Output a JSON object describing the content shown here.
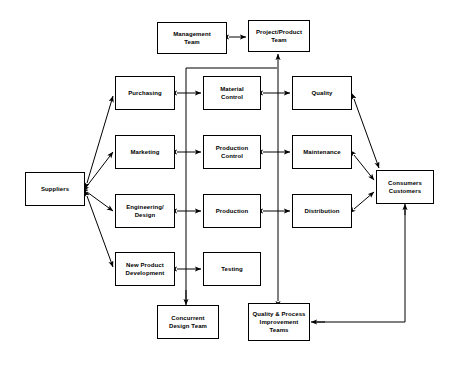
{
  "diagram": {
    "background_color": "#ffffff",
    "line_color": "#000000",
    "text_color": "#000000",
    "node_fill": "#ffffff",
    "nodes": [
      {
        "id": "management-team",
        "label": "Management\nTeam",
        "x": 157,
        "y": 22,
        "w": 70,
        "h": 32
      },
      {
        "id": "project-product-team",
        "label": "Project/Product\nTeam",
        "x": 248,
        "y": 20,
        "w": 62,
        "h": 32
      },
      {
        "id": "purchasing",
        "label": "Purchasing",
        "x": 115,
        "y": 76,
        "w": 60,
        "h": 34
      },
      {
        "id": "material-control",
        "label": "Material\nControl",
        "x": 203,
        "y": 76,
        "w": 58,
        "h": 34
      },
      {
        "id": "quality",
        "label": "Quality",
        "x": 292,
        "y": 76,
        "w": 60,
        "h": 34
      },
      {
        "id": "marketing",
        "label": "Marketing",
        "x": 115,
        "y": 135,
        "w": 60,
        "h": 34
      },
      {
        "id": "production-control",
        "label": "Production\nControl",
        "x": 203,
        "y": 135,
        "w": 58,
        "h": 34
      },
      {
        "id": "maintenance",
        "label": "Maintenance",
        "x": 292,
        "y": 135,
        "w": 60,
        "h": 34
      },
      {
        "id": "engineering-design",
        "label": "Engineering/\nDesign",
        "x": 115,
        "y": 194,
        "w": 60,
        "h": 34
      },
      {
        "id": "production",
        "label": "Production",
        "x": 203,
        "y": 194,
        "w": 58,
        "h": 34
      },
      {
        "id": "distribution",
        "label": "Distribution",
        "x": 292,
        "y": 194,
        "w": 60,
        "h": 34
      },
      {
        "id": "new-product-development",
        "label": "New Product\nDevelopment",
        "x": 115,
        "y": 252,
        "w": 60,
        "h": 34
      },
      {
        "id": "testing",
        "label": "Testing",
        "x": 203,
        "y": 252,
        "w": 58,
        "h": 34
      },
      {
        "id": "suppliers",
        "label": "Suppliers",
        "x": 25,
        "y": 172,
        "w": 60,
        "h": 34
      },
      {
        "id": "consumers-customers",
        "label": "Consumers\nCustomers",
        "x": 376,
        "y": 170,
        "w": 58,
        "h": 34
      },
      {
        "id": "concurrent-design-team",
        "label": "Concurrent\nDesign Team",
        "x": 157,
        "y": 305,
        "w": 62,
        "h": 34
      },
      {
        "id": "quality-process-teams",
        "label": "Quality & Process\nImprovement\nTeams",
        "x": 248,
        "y": 303,
        "w": 62,
        "h": 38
      }
    ],
    "connections": [
      {
        "from": "management-team",
        "to": "project-product-team",
        "style": "double-arrow",
        "path": "horizontal"
      },
      {
        "from": "purchasing",
        "to": "material-control",
        "style": "double-arrow",
        "path": "horizontal"
      },
      {
        "from": "material-control",
        "to": "quality",
        "style": "double-arrow",
        "path": "horizontal"
      },
      {
        "from": "marketing",
        "to": "production-control",
        "style": "double-arrow",
        "path": "horizontal"
      },
      {
        "from": "production-control",
        "to": "maintenance",
        "style": "double-arrow",
        "path": "horizontal"
      },
      {
        "from": "engineering-design",
        "to": "production",
        "style": "double-arrow",
        "path": "horizontal"
      },
      {
        "from": "production",
        "to": "distribution",
        "style": "double-arrow",
        "path": "horizontal"
      },
      {
        "from": "new-product-development",
        "to": "testing",
        "style": "double-arrow",
        "path": "horizontal"
      },
      {
        "from": "suppliers",
        "to": "purchasing",
        "style": "double-arrow",
        "path": "diagonal"
      },
      {
        "from": "suppliers",
        "to": "marketing",
        "style": "double-arrow",
        "path": "diagonal"
      },
      {
        "from": "suppliers",
        "to": "engineering-design",
        "style": "double-arrow",
        "path": "diagonal"
      },
      {
        "from": "suppliers",
        "to": "new-product-development",
        "style": "double-arrow",
        "path": "diagonal"
      },
      {
        "from": "quality",
        "to": "consumers-customers",
        "style": "double-arrow",
        "path": "diagonal"
      },
      {
        "from": "maintenance",
        "to": "consumers-customers",
        "style": "double-arrow",
        "path": "diagonal"
      },
      {
        "from": "distribution",
        "to": "consumers-customers",
        "style": "double-arrow",
        "path": "diagonal"
      },
      {
        "from": "concurrent-design-team",
        "to": "project-product-team",
        "style": "single-arrow",
        "path": "elbow-left"
      },
      {
        "from": "quality-process-teams",
        "to": "project-product-team",
        "style": "double-arrow",
        "path": "vertical"
      },
      {
        "from": "consumers-customers",
        "to": "quality-process-teams",
        "style": "single-arrow",
        "path": "elbow-right-feedback"
      }
    ]
  }
}
